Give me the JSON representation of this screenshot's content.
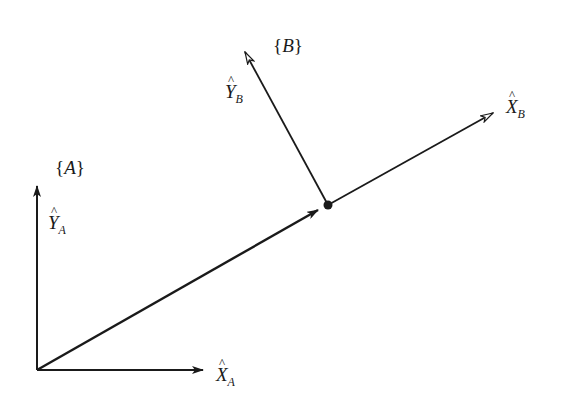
{
  "diagram": {
    "frames": [
      {
        "name": "A",
        "label": "{A}",
        "origin": [
          37,
          370
        ],
        "axes": [
          {
            "id": "X_A",
            "symbol": "X",
            "subscript": "A",
            "tip": [
              203,
              370
            ],
            "arrow": "filled"
          },
          {
            "id": "Y_A",
            "symbol": "Y",
            "subscript": "A",
            "tip": [
              37,
              185
            ],
            "arrow": "filled"
          }
        ]
      },
      {
        "name": "B",
        "label": "{B}",
        "origin": [
          328,
          205
        ],
        "axes": [
          {
            "id": "X_B",
            "symbol": "X",
            "subscript": "B",
            "tip": [
              493,
              113
            ],
            "arrow": "open"
          },
          {
            "id": "Y_B",
            "symbol": "Y",
            "subscript": "B",
            "tip": [
              244,
              50
            ],
            "arrow": "open"
          }
        ]
      }
    ],
    "position_vector": {
      "from": "A",
      "to": "B",
      "start": [
        37,
        370
      ],
      "end": [
        318,
        210
      ],
      "arrow": "filled"
    },
    "labels": {
      "frame_a": {
        "open": "{",
        "name": "A",
        "close": "}"
      },
      "frame_b": {
        "open": "{",
        "name": "B",
        "close": "}"
      },
      "x_a": {
        "symbol": "X",
        "sub": "A"
      },
      "y_a": {
        "symbol": "Y",
        "sub": "A"
      },
      "x_b": {
        "symbol": "X",
        "sub": "B"
      },
      "y_b": {
        "symbol": "Y",
        "sub": "B"
      }
    },
    "colors": {
      "line": "#1a1a1a",
      "background": "#ffffff"
    }
  }
}
